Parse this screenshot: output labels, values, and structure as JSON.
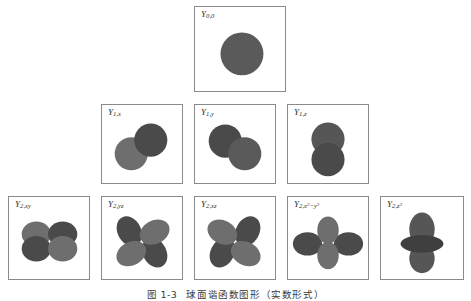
{
  "figure": {
    "caption_number": "图 1-3",
    "caption_text": "球面谐函数图形（实数形式）",
    "background_color": "#ffffff",
    "panel_border_color": "#8a8a8a",
    "lobe_color_light": "#6e6e6e",
    "lobe_color_dark": "#4a4a4a",
    "lobe_color_medium": "#5a5a5a"
  },
  "rows": [
    {
      "name": "row-s",
      "panels": [
        {
          "id": "Y00",
          "label_base": "Y",
          "label_sub": "0,0",
          "label_sub_html": "0,0",
          "orbital_type": "s",
          "description": "single sphere centered in panel"
        }
      ]
    },
    {
      "name": "row-p",
      "panels": [
        {
          "id": "Y1x",
          "label_base": "Y",
          "label_sub": "1,x",
          "label_sub_html": "1,<i>x</i>",
          "orbital_type": "p-diagonal-up",
          "description": "two overlapping circles, light lower-left and dark upper-right"
        },
        {
          "id": "Y1y",
          "label_base": "Y",
          "label_sub": "1,y",
          "label_sub_html": "1,<i>y</i>",
          "orbital_type": "p-diagonal-down",
          "description": "two overlapping circles, dark upper-left and medium lower-right"
        },
        {
          "id": "Y1z",
          "label_base": "Y",
          "label_sub": "1,z",
          "label_sub_html": "1,<i>z</i>",
          "orbital_type": "p-vertical",
          "description": "two vertically stacked circles"
        }
      ]
    },
    {
      "name": "row-d",
      "panels": [
        {
          "id": "Y2xy",
          "label_base": "Y",
          "label_sub": "2,xy",
          "label_sub_html": "2,<i>xy</i>",
          "orbital_type": "d-butterfly",
          "description": "four lobes in butterfly arrangement, alternating light and dark"
        },
        {
          "id": "Y2yz",
          "label_base": "Y",
          "label_sub": "2,yz",
          "label_sub_html": "2,<i>yz</i>",
          "orbital_type": "d-cloverleaf-diagonal",
          "description": "four diagonal lobes, dark upper-left and lower-right"
        },
        {
          "id": "Y2xz",
          "label_base": "Y",
          "label_sub": "2,xz",
          "label_sub_html": "2,<i>xz</i>",
          "orbital_type": "d-cloverleaf-diagonal-mirror",
          "description": "four diagonal lobes, dark upper-right and lower-left"
        },
        {
          "id": "Y2x2y2",
          "label_base": "Y",
          "label_sub": "2,x²−y²",
          "label_sub_html": "2,<i>x</i><sup>2</sup>−<i>y</i><sup>2</sup>",
          "orbital_type": "d-x2y2",
          "description": "dark horizontal lobes with lighter vertical lobes"
        },
        {
          "id": "Y2z2",
          "label_base": "Y",
          "label_sub": "2,z²",
          "label_sub_html": "2,<i>z</i><sup>2</sup>",
          "orbital_type": "d-z2",
          "description": "two vertical lobes with dark torus ring at center"
        }
      ]
    }
  ]
}
